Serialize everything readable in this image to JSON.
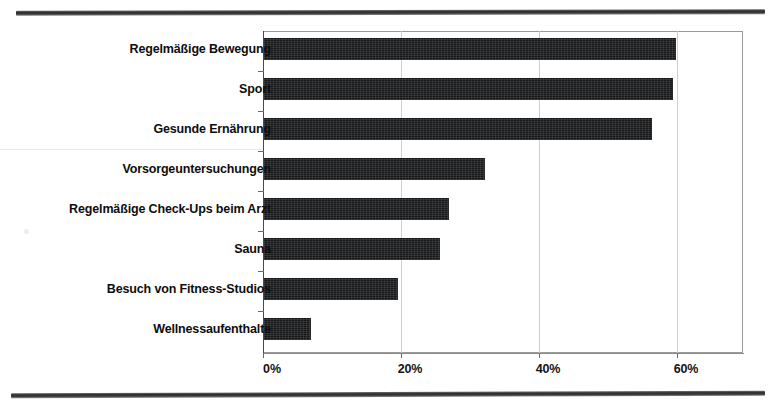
{
  "chart_data": {
    "type": "bar",
    "orientation": "horizontal",
    "title": "",
    "subtitle": "",
    "xlabel": "",
    "ylabel": "",
    "categories": [
      "Regelmäßige Bewegung",
      "Sport",
      "Gesunde Ernährung",
      "Vorsorgeuntersuchungen",
      "Regelmäßige Check-Ups beim Arzt",
      "Sauna",
      "Besuch von Fitness-Studios",
      "Wellnessaufenthalte"
    ],
    "values": [
      59.7,
      59.3,
      56.2,
      32.1,
      26.8,
      25.5,
      19.4,
      6.8
    ],
    "value_unit": "%",
    "xlim": [
      0,
      69.5
    ],
    "xticks": [
      0,
      20,
      40,
      60
    ],
    "xtick_labels": [
      "0%",
      "20%",
      "40%",
      "60%"
    ],
    "grid": true,
    "grid_axis": "x",
    "legend": null,
    "series": [
      {
        "name": "Anteil",
        "color": "#17181a",
        "values": [
          59.7,
          59.3,
          56.2,
          32.1,
          26.8,
          25.5,
          19.4,
          6.8
        ]
      }
    ],
    "annotations": []
  },
  "figure": {
    "background_color": "#ffffff",
    "bar_color": "#17181a",
    "frame_color": "#9a9a9a",
    "grid_color": "#cfcfcf",
    "axis_color": "#4a4a4a",
    "rule_color": "#2e2e2e",
    "top_rule_label": "page-rule-top",
    "bottom_rule_label": "page-rule-bottom"
  }
}
